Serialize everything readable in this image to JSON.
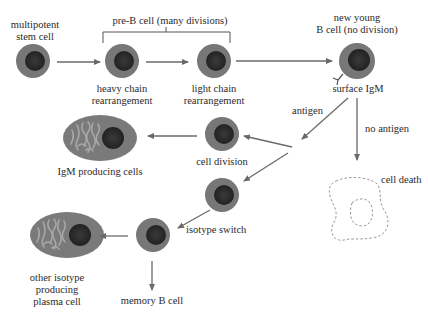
{
  "colors": {
    "cell_outer": "#777777",
    "cell_nucleus": "#2b2b2b",
    "arrow": "#6a6a6a",
    "plasma_body": "#7a7a7a",
    "plasma_er": "#a8a8a8",
    "dead_cell_outline": "#9a9a9a",
    "text": "#2a2a2a"
  },
  "labels": {
    "stem_cell": [
      "multipotent",
      "stem cell"
    ],
    "pre_b_bracket": "pre-B cell (many divisions)",
    "heavy_chain": [
      "heavy chain",
      "rearrangement"
    ],
    "light_chain": [
      "light chain",
      "rearrangement"
    ],
    "new_b_cell": [
      "new young",
      "B cell (no division)"
    ],
    "surface_igm": "surface IgM",
    "antigen": "antigen",
    "no_antigen": "no antigen",
    "cell_division": "cell division",
    "igm_producing": "IgM producing cells",
    "cell_death": "cell death",
    "isotype_switch": "isotype switch",
    "other_isotype": [
      "other isotype",
      "producing",
      "plasma cell"
    ],
    "memory_b": "memory B cell"
  },
  "nodes": [
    {
      "id": "stem-cell",
      "type": "cell",
      "cx": 33,
      "cy": 61
    },
    {
      "id": "heavy-chain-cell",
      "type": "cell",
      "cx": 122,
      "cy": 61
    },
    {
      "id": "light-chain-cell",
      "type": "cell",
      "cx": 214,
      "cy": 61
    },
    {
      "id": "new-young-b-cell",
      "type": "cell",
      "cx": 357,
      "cy": 61
    },
    {
      "id": "cell-division-cell",
      "type": "cell",
      "cx": 222,
      "cy": 134
    },
    {
      "id": "igm-plasma-cell",
      "type": "plasma",
      "cx": 100,
      "cy": 138
    },
    {
      "id": "isotype-switch-cell",
      "type": "cell",
      "cx": 222,
      "cy": 195
    },
    {
      "id": "memory-precursor-cell",
      "type": "cell",
      "cx": 153,
      "cy": 235
    },
    {
      "id": "other-isotype-plasma-cell",
      "type": "plasma",
      "cx": 67,
      "cy": 235
    },
    {
      "id": "dead-cell",
      "type": "dead",
      "cx": 355,
      "cy": 205
    }
  ],
  "edges": [
    {
      "from": "stem-cell",
      "to": "heavy-chain-cell"
    },
    {
      "from": "heavy-chain-cell",
      "to": "light-chain-cell"
    },
    {
      "from": "light-chain-cell",
      "to": "new-young-b-cell"
    },
    {
      "from": "new-young-b-cell",
      "to": "branch-point",
      "label": "antigen"
    },
    {
      "from": "new-young-b-cell",
      "to": "dead-cell",
      "label": "no antigen"
    },
    {
      "from": "branch-point",
      "to": "cell-division-cell"
    },
    {
      "from": "branch-point",
      "to": "isotype-switch-cell"
    },
    {
      "from": "cell-division-cell",
      "to": "igm-plasma-cell"
    },
    {
      "from": "isotype-switch-cell",
      "to": "memory-precursor-cell",
      "label": "isotype switch"
    },
    {
      "from": "memory-precursor-cell",
      "to": "other-isotype-plasma-cell"
    },
    {
      "from": "memory-precursor-cell",
      "to": "memory-b-cell-label"
    }
  ]
}
